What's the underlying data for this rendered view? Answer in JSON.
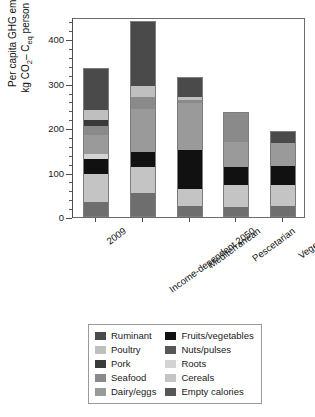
{
  "chart_data": {
    "type": "bar",
    "subtype": "stacked",
    "title": "",
    "xlabel": "",
    "ylabel": "Per capita GHG emissions kg CO2-Ceq person per year",
    "ylim": [
      0,
      450
    ],
    "yticks": [
      0,
      100,
      200,
      300,
      400
    ],
    "ytick_labels": [
      "0",
      "100",
      "200",
      "300",
      "400"
    ],
    "minor_tick_interval": 20,
    "grid": false,
    "legend_position": "below-plot",
    "categories": [
      "2009",
      "Income-dependent 2050",
      "Mediterranean",
      "Pescetarian",
      "Vegetarian"
    ],
    "series": [
      {
        "name": "Empty calories",
        "color": "#6e6e6e",
        "values": [
          34,
          55,
          25,
          22,
          25
        ]
      },
      {
        "name": "Cereals",
        "color": "#c4c4c4",
        "values": [
          62,
          57,
          38,
          50,
          48
        ]
      },
      {
        "name": "Fruits/vegetables",
        "color": "#111111",
        "values": [
          35,
          35,
          87,
          40,
          42
        ]
      },
      {
        "name": "Roots",
        "color": "#d3d3d3",
        "values": [
          10,
          0,
          0,
          0,
          0
        ]
      },
      {
        "name": "Nuts/pulses",
        "color": "#575757",
        "values": [
          0,
          0,
          0,
          0,
          0
        ]
      },
      {
        "name": "Dairy/eggs",
        "color": "#9a9a9a",
        "values": [
          44,
          96,
          106,
          56,
          52
        ]
      },
      {
        "name": "Seafood",
        "color": "#8a8a8a",
        "values": [
          19,
          28,
          8,
          69,
          0
        ]
      },
      {
        "name": "Pork",
        "color": "#3a3a3a",
        "values": [
          14,
          0,
          0,
          0,
          0
        ]
      },
      {
        "name": "Poultry",
        "color": "#bfbfbf",
        "values": [
          22,
          24,
          5,
          0,
          0
        ]
      },
      {
        "name": "Ruminant",
        "color": "#4a4a4a",
        "values": [
          95,
          147,
          47,
          0,
          26
        ]
      }
    ],
    "totals": [
      335,
      442,
      316,
      237,
      193
    ]
  },
  "axes": {
    "y_title_line1": "Per capita GHG emissions",
    "y_title_line2_pre": "kg CO",
    "y_title_line2_sub1": "2",
    "y_title_line2_mid": "– C",
    "y_title_line2_sub2": "eq",
    "y_title_line2_post": " person per year"
  },
  "legend": {
    "left_column": [
      {
        "label": "Ruminant",
        "color": "#4a4a4a"
      },
      {
        "label": "Poultry",
        "color": "#bfbfbf"
      },
      {
        "label": "Pork",
        "color": "#3a3a3a"
      },
      {
        "label": "Seafood",
        "color": "#8a8a8a"
      },
      {
        "label": "Dairy/eggs",
        "color": "#9a9a9a"
      }
    ],
    "right_column": [
      {
        "label": "Fruits/vegetables",
        "color": "#111111"
      },
      {
        "label": "Nuts/pulses",
        "color": "#575757"
      },
      {
        "label": "Roots",
        "color": "#d3d3d3"
      },
      {
        "label": "Cereals",
        "color": "#c4c4c4"
      },
      {
        "label": "Empty calories",
        "color": "#575757"
      }
    ]
  }
}
